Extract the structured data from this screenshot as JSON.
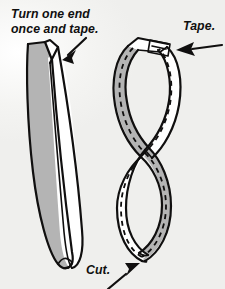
{
  "illustration": {
    "title": "Mobius strip construction instructions",
    "style": "black-and-white line drawing with gray shading",
    "background_color": "#f7f7f5",
    "ink_color": "#100f0f",
    "shade_color": "#b4b4b4",
    "paper_face_color": "#ffffff"
  },
  "labels": {
    "turn": "Turn one end\nonce and tape.",
    "tape": "Tape.",
    "cut": "Cut."
  },
  "figures": [
    {
      "name": "untwisted-strip",
      "position": "left",
      "description": "A long paper strip held in a loop with one end given a half twist, showing gray back face and white front face"
    },
    {
      "name": "mobius-band",
      "position": "right",
      "description": "The finished taped Mobius band in a figure-eight shape with a dashed line marking the cut path down the middle"
    }
  ],
  "annotations": [
    {
      "name": "turn-arrow",
      "points_to": "twisted end of the left strip",
      "direction": "down-left"
    },
    {
      "name": "tape-arrow",
      "points_to": "taped joint at top of band",
      "direction": "left"
    },
    {
      "name": "cut-arrow",
      "points_to": "dashed cut line at bottom of band",
      "direction": "up-right"
    }
  ],
  "tape_piece": {
    "name": "tape-patch",
    "description": "small rectangular piece of tape across the joined ends"
  },
  "cut_line": {
    "name": "dashed-cut-line",
    "style": "dashed",
    "description": "dashed center line running the full length of the band"
  }
}
